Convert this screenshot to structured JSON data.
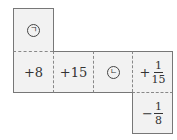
{
  "net": {
    "top": {
      "label": "ㄱ",
      "type": "circled"
    },
    "row": [
      {
        "label": "+8",
        "type": "text"
      },
      {
        "label": "+15",
        "type": "text"
      },
      {
        "label": "ㄴ",
        "type": "circled"
      },
      {
        "sign": "+",
        "numerator": "1",
        "denominator": "15",
        "type": "fraction"
      }
    ],
    "bottom": {
      "sign": "−",
      "numerator": "1",
      "denominator": "8",
      "type": "fraction"
    }
  }
}
